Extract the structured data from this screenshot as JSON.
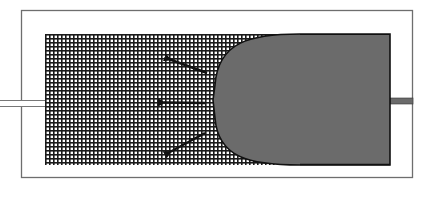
{
  "figure": {
    "colors": {
      "background": "#ffffff",
      "frame": "#6e6e6e",
      "mesh_line": "#1a1a1a",
      "mesh_bg": "#ffffff",
      "fluid": "#6b6b6b",
      "fluid_edge": "#111111",
      "arrow": "#111111",
      "outlet": "#6b6b6b"
    },
    "frame": {
      "x": 21,
      "y": 10,
      "w": 392,
      "h": 168
    },
    "mesh": {
      "x": 45,
      "y": 34,
      "w": 345,
      "h": 131,
      "cell": 4
    },
    "inlet_channel": {
      "x": 0,
      "y": 100,
      "w": 45,
      "h": 7
    },
    "outlet_channel": {
      "x": 390,
      "y": 98,
      "w": 23,
      "h": 6
    },
    "fluid_region": {
      "x_front": 213,
      "x_end": 390,
      "y_top": 34,
      "y_bottom": 165
    },
    "arrows": [
      {
        "name": "arrow-upper-left",
        "x1": 207,
        "y1": 73,
        "x2": 166,
        "y2": 58
      },
      {
        "name": "arrow-left",
        "x1": 205,
        "y1": 103,
        "x2": 160,
        "y2": 102
      },
      {
        "name": "arrow-lower-left",
        "x1": 205,
        "y1": 133,
        "x2": 166,
        "y2": 154
      }
    ]
  }
}
